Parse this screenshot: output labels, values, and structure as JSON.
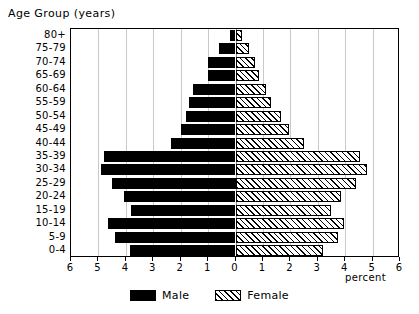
{
  "chart_data": {
    "type": "bar",
    "title": "Age Group (years)",
    "subtitle": "",
    "xlabel": "percent",
    "ylabel": "Age Group (years)",
    "orientation": "horizontal",
    "style": "population-pyramid",
    "grid": true,
    "legend_position": "bottom-center",
    "xlim": [
      -6,
      6
    ],
    "x_tick_labels": [
      "6",
      "5",
      "4",
      "3",
      "2",
      "1",
      "0",
      "1",
      "2",
      "3",
      "4",
      "5",
      "6"
    ],
    "x_tick_values": [
      -6,
      -5,
      -4,
      -3,
      -2,
      -1,
      0,
      1,
      2,
      3,
      4,
      5,
      6
    ],
    "categories": [
      "80+",
      "75-79",
      "70-74",
      "65-69",
      "60-64",
      "55-59",
      "50-54",
      "45-49",
      "40-44",
      "35-39",
      "30-34",
      "25-29",
      "20-24",
      "15-19",
      "10-14",
      "5-9",
      "0-4"
    ],
    "series": [
      {
        "name": "Male",
        "color": "#000000",
        "fill": "solid-black",
        "side": "left",
        "values": [
          0.2,
          0.6,
          1.0,
          1.0,
          1.55,
          1.7,
          1.8,
          2.0,
          2.35,
          4.8,
          4.9,
          4.5,
          4.05,
          3.8,
          4.65,
          4.4,
          3.85
        ]
      },
      {
        "name": "Female",
        "color": "#ffffff",
        "fill": "diagonal-hatch",
        "side": "right",
        "values": [
          0.25,
          0.5,
          0.7,
          0.85,
          1.1,
          1.3,
          1.65,
          1.95,
          2.5,
          4.55,
          4.8,
          4.4,
          3.85,
          3.5,
          3.95,
          3.75,
          3.2
        ]
      }
    ]
  },
  "legend": {
    "items": [
      {
        "label": "Male",
        "swatch": "male"
      },
      {
        "label": "Female",
        "swatch": "female"
      }
    ]
  },
  "axis": {
    "percent_label": "percent"
  }
}
